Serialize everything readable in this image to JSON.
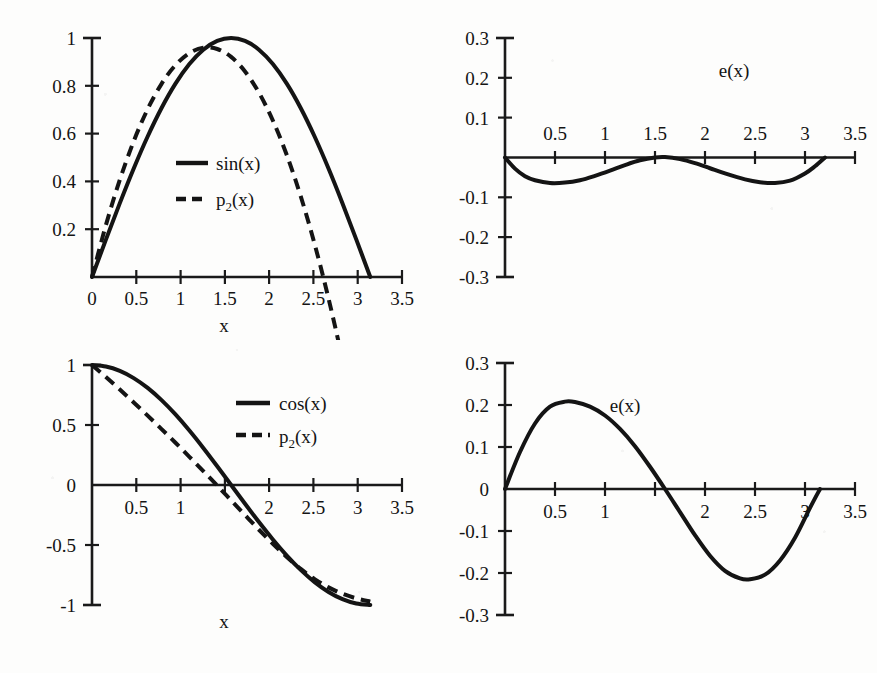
{
  "figure": {
    "kind": "four-panel-scanned-figure",
    "background_color": "#fdfdfc",
    "ink_color": "#141414"
  },
  "chart_data": [
    {
      "id": "top-left",
      "type": "line",
      "title": "",
      "xlabel": "x",
      "ylabel": "",
      "xlim": [
        0,
        3.5
      ],
      "ylim": [
        0,
        1
      ],
      "xticks": [
        0,
        0.5,
        1,
        1.5,
        2,
        2.5,
        3,
        3.5
      ],
      "xticklabels": [
        "0",
        "0.5",
        "1",
        "1.5",
        "2",
        "2.5",
        "3",
        "3.5"
      ],
      "yticks": [
        0.2,
        0.4,
        0.6,
        0.8,
        1
      ],
      "yticklabels": [
        "0.2",
        "0.4",
        "0.6",
        "0.8",
        "1"
      ],
      "grid": false,
      "legend_position": "center",
      "series": [
        {
          "name": "sin(x)",
          "style": "solid",
          "x": [
            0,
            0.1571,
            0.3142,
            0.4712,
            0.6283,
            0.7854,
            0.9425,
            1.0996,
            1.2566,
            1.4137,
            1.5708,
            1.7279,
            1.885,
            2.042,
            2.1991,
            2.3562,
            2.5133,
            2.6704,
            2.8274,
            2.9845,
            3.1416
          ],
          "y": [
            0,
            0.1564,
            0.309,
            0.454,
            0.5878,
            0.7071,
            0.809,
            0.891,
            0.9511,
            0.9877,
            1,
            0.9877,
            0.9511,
            0.891,
            0.809,
            0.7071,
            0.5878,
            0.454,
            0.309,
            0.1564,
            0
          ]
        },
        {
          "name": "p_2(x)",
          "label_base": "p",
          "label_sub": "2",
          "label_tail": "(x)",
          "style": "dashed",
          "x": [
            0,
            0.1571,
            0.3142,
            0.4712,
            0.6283,
            0.7854,
            0.9425,
            1.0996,
            1.2566,
            1.4137,
            1.5708,
            1.7279,
            1.885,
            2.042,
            2.1991,
            2.3562,
            2.5133,
            2.6704,
            2.8274,
            2.9845,
            3.1416
          ],
          "y": [
            0,
            0.2173,
            0.4067,
            0.5684,
            0.7022,
            0.8082,
            0.8864,
            0.9368,
            0.9593,
            0.954,
            0.9209,
            0.86,
            0.7712,
            0.6547,
            0.5103,
            0.3381,
            0.1381,
            -0.0898,
            -0.3455,
            -0.629,
            -0.9403
          ]
        }
      ],
      "notes": "sin(x) on [0, pi] with its degree-2 least-squares / Taylor-like approximation p2(x); the two nearly coincide over the interval."
    },
    {
      "id": "top-right",
      "type": "line",
      "title": "e(x)",
      "xlabel": "",
      "ylabel": "",
      "xlim": [
        0,
        3.5
      ],
      "ylim": [
        -0.3,
        0.3
      ],
      "xticks": [
        0,
        0.5,
        1,
        1.5,
        2,
        2.5,
        3,
        3.5
      ],
      "xticklabels": [
        "",
        "0.5",
        "1",
        "1.5",
        "2",
        "2.5",
        "3",
        "3.5"
      ],
      "yticks": [
        -0.3,
        -0.2,
        -0.1,
        0.1,
        0.2,
        0.3
      ],
      "yticklabels": [
        "-0.3",
        "-0.2",
        "-0.1",
        "0.1",
        "0.2",
        "0.3"
      ],
      "grid": false,
      "xtick_label_side": "above",
      "series": [
        {
          "name": "e(x)",
          "style": "solid",
          "x": [
            0,
            0.1,
            0.2,
            0.3,
            0.45,
            0.6,
            0.75,
            0.9,
            1.05,
            1.2,
            1.35,
            1.5,
            1.6,
            1.75,
            1.9,
            2.05,
            2.2,
            2.4,
            2.55,
            2.7,
            2.85,
            3.0,
            3.1,
            3.2
          ],
          "y": [
            0,
            -0.028,
            -0.047,
            -0.057,
            -0.064,
            -0.063,
            -0.057,
            -0.046,
            -0.033,
            -0.019,
            -0.007,
            0.0,
            0.001,
            -0.004,
            -0.014,
            -0.027,
            -0.04,
            -0.055,
            -0.062,
            -0.064,
            -0.058,
            -0.04,
            -0.022,
            0.0
          ]
        }
      ],
      "notes": "Error curve e(x) = sin(x) - p2(x); equioscillating with extrema near -0.064 around x=0.5 and x=2.7, touching 0 near x=0, 1.5 and 3.2."
    },
    {
      "id": "bottom-left",
      "type": "line",
      "title": "",
      "xlabel": "x",
      "ylabel": "",
      "xlim": [
        0,
        3.5
      ],
      "ylim": [
        -1,
        1
      ],
      "xticks": [
        0,
        0.5,
        1,
        1.5,
        2,
        2.5,
        3,
        3.5
      ],
      "xticklabels": [
        "",
        "0.5",
        "1",
        "",
        "2",
        "2.5",
        "3",
        "3.5"
      ],
      "yticks": [
        -1,
        -0.5,
        0,
        0.5,
        1
      ],
      "yticklabels": [
        "-1",
        "-0.5",
        "0",
        "0.5",
        "1"
      ],
      "grid": false,
      "legend_position": "upper-right",
      "xtick_label_side": "below",
      "series": [
        {
          "name": "cos(x)",
          "style": "solid",
          "x": [
            0,
            0.1571,
            0.3142,
            0.4712,
            0.6283,
            0.7854,
            0.9425,
            1.0996,
            1.2566,
            1.4137,
            1.5708,
            1.7279,
            1.885,
            2.042,
            2.1991,
            2.3562,
            2.5133,
            2.6704,
            2.8274,
            2.9845,
            3.1416
          ],
          "y": [
            1,
            0.9877,
            0.9511,
            0.891,
            0.809,
            0.7071,
            0.5878,
            0.454,
            0.309,
            0.1564,
            0,
            -0.1564,
            -0.309,
            -0.454,
            -0.5878,
            -0.7071,
            -0.809,
            -0.891,
            -0.9511,
            -0.9877,
            -1
          ]
        },
        {
          "name": "p_2(x)",
          "label_base": "p",
          "label_sub": "2",
          "label_tail": "(x)",
          "style": "dashed",
          "x": [
            0,
            0.1571,
            0.3142,
            0.4712,
            0.6283,
            0.7854,
            0.9425,
            1.0996,
            1.2566,
            1.4137,
            1.5708,
            1.7279,
            1.885,
            2.042,
            2.1991,
            2.3562,
            2.5133,
            2.6704,
            2.8274,
            2.9845,
            3.1416
          ],
          "y": [
            1,
            0.9,
            0.795,
            0.688,
            0.578,
            0.466,
            0.352,
            0.235,
            0.116,
            -0.005,
            -0.128,
            -0.251,
            -0.373,
            -0.49,
            -0.6,
            -0.699,
            -0.784,
            -0.853,
            -0.906,
            -0.945,
            -0.972
          ]
        }
      ],
      "notes": "cos(x) on [0, pi] with its degree-2 approximation p2(x); p2 sags below cos for small x and lies above it past x~1.6."
    },
    {
      "id": "bottom-right",
      "type": "line",
      "title": "e(x)",
      "xlabel": "",
      "ylabel": "",
      "xlim": [
        0,
        3.5
      ],
      "ylim": [
        -0.3,
        0.3
      ],
      "xticks": [
        0,
        0.5,
        1,
        1.5,
        2,
        2.5,
        3,
        3.5
      ],
      "xticklabels": [
        "",
        "0.5",
        "1",
        "",
        "2",
        "2.5",
        "3",
        "3.5"
      ],
      "yticks": [
        -0.3,
        -0.2,
        -0.1,
        0,
        0.1,
        0.2,
        0.3
      ],
      "yticklabels": [
        "-0.3",
        "-0.2",
        "-0.1",
        "0",
        "0.1",
        "0.2",
        "0.3"
      ],
      "grid": false,
      "xtick_label_side": "below",
      "series": [
        {
          "name": "e(x)",
          "style": "solid",
          "x": [
            0,
            0.15,
            0.3,
            0.45,
            0.6,
            0.7,
            0.85,
            1.0,
            1.15,
            1.3,
            1.45,
            1.6,
            1.75,
            1.9,
            2.05,
            2.2,
            2.35,
            2.45,
            2.6,
            2.75,
            2.9,
            3.05,
            3.15
          ],
          "y": [
            0,
            0.088,
            0.156,
            0.196,
            0.208,
            0.207,
            0.196,
            0.175,
            0.143,
            0.102,
            0.053,
            0.0,
            -0.055,
            -0.11,
            -0.159,
            -0.195,
            -0.213,
            -0.215,
            -0.204,
            -0.17,
            -0.116,
            -0.045,
            0.0
          ]
        }
      ],
      "notes": "Error curve e(x) = cos(x) - p2(x) with a maximum of about 0.21 near x=0.7 and a minimum of about -0.215 near x=2.45, vanishing near x=0, 1.6 and 3.2."
    }
  ],
  "labels": {
    "x_axis_name": "x",
    "error_label": "e(x)",
    "sin_label": "sin(x)",
    "cos_label": "cos(x)",
    "poly_base": "p",
    "poly_sub": "2",
    "poly_tail": "(x)"
  }
}
